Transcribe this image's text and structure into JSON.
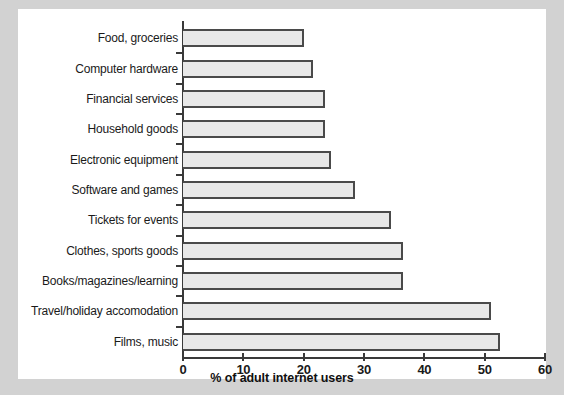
{
  "chart_data": {
    "type": "bar",
    "orientation": "horizontal",
    "title": "",
    "xlabel": "% of adult internet users",
    "ylabel": "",
    "xlim": [
      0,
      60
    ],
    "xticks": [
      0,
      10,
      20,
      30,
      40,
      50,
      60
    ],
    "grid": false,
    "legend": null,
    "categories": [
      "Food, groceries",
      "Computer hardware",
      "Financial services",
      "Household goods",
      "Electronic equipment",
      "Software and games",
      "Tickets for events",
      "Clothes, sports goods",
      "Books/magazines/learning",
      "Travel/holiday accomodation",
      "Films, music"
    ],
    "values": [
      20,
      21.5,
      23.5,
      23.5,
      24.5,
      28.5,
      34.5,
      36.5,
      36.5,
      51,
      52.5
    ],
    "bar_fill_color": "#e8e8e8",
    "bar_border_color": "#4a4a4a",
    "axis_color": "#3a3a3a",
    "panel_color": "#ffffff",
    "background_color": "#d2d2d2"
  }
}
